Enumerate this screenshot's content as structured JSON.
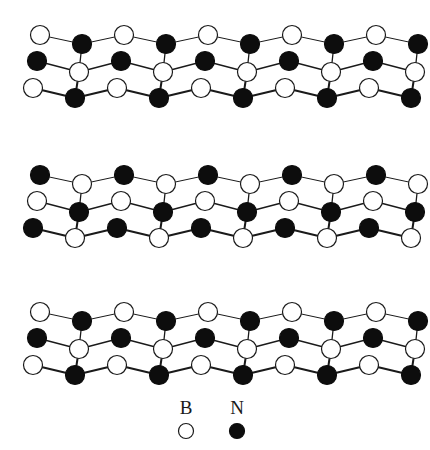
{
  "figure": {
    "title": "",
    "background_color": "#ffffff",
    "atom_colors": {
      "boron": "#ffffff",
      "boron_outline": "#1a1a1a",
      "nitrogen": "#0d0d0d"
    },
    "bond_color": "#1a1a1a",
    "atom_radius": 9.5,
    "legend_atom_radius": 7.5
  },
  "legend": {
    "items": [
      {
        "label": "B",
        "symbol": "open-circle",
        "fill": "#ffffff",
        "stroke": "#1a1a1a",
        "cx": 186,
        "cy": 431,
        "label_x": 186,
        "label_y": 414
      },
      {
        "label": "N",
        "symbol": "filled-circle",
        "fill": "#0d0d0d",
        "stroke": "#0d0d0d",
        "cx": 237,
        "cy": 431,
        "label_x": 237,
        "label_y": 414
      }
    ]
  },
  "chart_data": {
    "type": "diagram",
    "xlabel": "",
    "ylabel": "",
    "layers": [
      {
        "name": "top-layer",
        "y_offset": 0,
        "inverted": false
      },
      {
        "name": "middle-layer",
        "y_offset": 140,
        "inverted": true
      },
      {
        "name": "bottom-layer",
        "y_offset": 277,
        "inverted": false
      }
    ],
    "layer_geometry": {
      "rows": [
        {
          "name": "back-row",
          "y_apex": 35,
          "y_base": 44,
          "x_start": 40,
          "stroke_width": 1.0
        },
        {
          "name": "middle-row",
          "y_apex": 61,
          "y_base": 72,
          "x_start": 37,
          "stroke_width": 1.3
        },
        {
          "name": "front-row",
          "y_apex": 88,
          "y_base": 98,
          "x_start": 33,
          "stroke_width": 2.0
        }
      ],
      "hex_pitch": 84,
      "half_pitch": 42,
      "cells_per_row": 4,
      "row_x_shift": -4
    }
  }
}
